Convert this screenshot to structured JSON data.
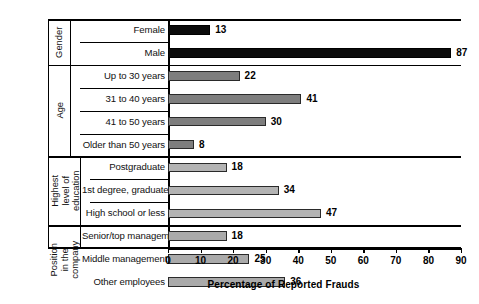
{
  "chart_data": {
    "type": "bar",
    "orientation": "horizontal",
    "title": "",
    "xlabel": "Percentage of Reported Frauds",
    "ylabel": "",
    "xlim": [
      0,
      90
    ],
    "xticks": [
      0,
      10,
      20,
      30,
      40,
      50,
      60,
      70,
      80,
      90
    ],
    "grid": false,
    "legend": "none",
    "groups": [
      {
        "name": "Gender",
        "color": "#0b0b0b",
        "shade": "black",
        "categories": [
          "Female",
          "Male"
        ],
        "values": [
          13,
          87
        ]
      },
      {
        "name": "Age",
        "color": "#7e7e7e",
        "shade": "mid",
        "categories": [
          "Up to 30 years",
          "31 to 40 years",
          "41 to 50 years",
          "Older than 50 years"
        ],
        "values": [
          22,
          41,
          30,
          8
        ]
      },
      {
        "name": "Highest\nlevel of\neducation",
        "color": "#b3b3b3",
        "shade": "light",
        "categories": [
          "Postgraduate",
          "1st degree, graduate",
          "High school or less"
        ],
        "values": [
          18,
          34,
          47
        ]
      },
      {
        "name": "Position\nin the\ncompany",
        "color": "#aaaaaa",
        "shade": "light2",
        "categories": [
          "Senior/top management",
          "Middle management",
          "Other employees"
        ],
        "values": [
          18,
          25,
          36
        ]
      }
    ],
    "categories": [
      "Female",
      "Male",
      "Up to 30 years",
      "31 to 40 years",
      "41 to 50 years",
      "Older than 50 years",
      "Postgraduate",
      "1st degree, graduate",
      "High school or less",
      "Senior/top management",
      "Middle management",
      "Other employees"
    ],
    "values": [
      13,
      87,
      22,
      41,
      30,
      8,
      18,
      34,
      47,
      18,
      25,
      36
    ]
  },
  "axis": {
    "tick_labels": [
      "0",
      "10",
      "20",
      "30",
      "40",
      "50",
      "60",
      "70",
      "80",
      "90"
    ],
    "title": "Percentage of Reported Frauds"
  },
  "group_labels": {
    "gender": "Gender",
    "age": "Age",
    "education": "Highest\nlevel of\neducation",
    "position": "Position\nin the\ncompany"
  }
}
